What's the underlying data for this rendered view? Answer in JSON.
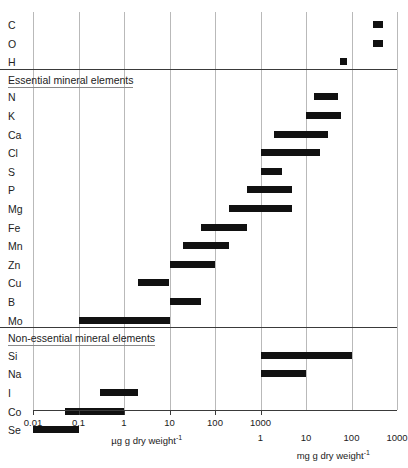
{
  "chart_data": {
    "type": "bar",
    "orientation": "horizontal-range",
    "title": "",
    "xlabel_primary": "µg g dry weight",
    "xlabel_primary_sup": "-1",
    "xlabel_secondary": "mg g dry weight",
    "xlabel_secondary_sup": "-1",
    "ylabel": "",
    "scale": "log",
    "axis_primary_unit": "ug",
    "axis_secondary_unit": "mg",
    "axis_decades_min_ug": 0.01,
    "axis_decades_max_ug": 1000000,
    "ticks_primary": [
      "0.01",
      "0.1",
      "1",
      "10",
      "100",
      "1000"
    ],
    "ticks_secondary": [
      "1",
      "10",
      "100",
      "1000"
    ],
    "sections": [
      {
        "title": "",
        "has_title": false,
        "elements": [
          {
            "label": "C",
            "start_ug": 300000,
            "end_ug": 500000
          },
          {
            "label": "O",
            "start_ug": 300000,
            "end_ug": 500000
          },
          {
            "label": "H",
            "start_ug": 55000,
            "end_ug": 80000
          }
        ]
      },
      {
        "title": "Essential mineral elements",
        "has_title": true,
        "elements": [
          {
            "label": "N",
            "start_ug": 15000,
            "end_ug": 50000
          },
          {
            "label": "K",
            "start_ug": 10000,
            "end_ug": 60000
          },
          {
            "label": "Ca",
            "start_ug": 2000,
            "end_ug": 30000
          },
          {
            "label": "Cl",
            "start_ug": 1000,
            "end_ug": 20000
          },
          {
            "label": "S",
            "start_ug": 1000,
            "end_ug": 3000
          },
          {
            "label": "P",
            "start_ug": 500,
            "end_ug": 5000
          },
          {
            "label": "Mg",
            "start_ug": 200,
            "end_ug": 5000
          },
          {
            "label": "Fe",
            "start_ug": 50,
            "end_ug": 500
          },
          {
            "label": "Mn",
            "start_ug": 20,
            "end_ug": 200
          },
          {
            "label": "Zn",
            "start_ug": 10,
            "end_ug": 100
          },
          {
            "label": "Cu",
            "start_ug": 2,
            "end_ug": 10
          },
          {
            "label": "B",
            "start_ug": 10,
            "end_ug": 50
          },
          {
            "label": "Mo",
            "start_ug": 0.1,
            "end_ug": 10
          }
        ]
      },
      {
        "title": "Non-essential mineral elements",
        "has_title": true,
        "elements": [
          {
            "label": "Si",
            "start_ug": 1000,
            "end_ug": 100000
          },
          {
            "label": "Na",
            "start_ug": 1000,
            "end_ug": 10000
          },
          {
            "label": "I",
            "start_ug": 0.3,
            "end_ug": 2
          },
          {
            "label": "Co",
            "start_ug": 0.05,
            "end_ug": 1
          },
          {
            "label": "Se",
            "start_ug": 0.01,
            "end_ug": 0.1
          }
        ]
      }
    ]
  }
}
